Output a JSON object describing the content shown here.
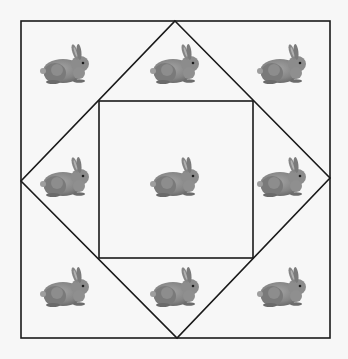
{
  "figure": {
    "background_color": "#f7f7f7",
    "line_color": "#1a1a1a",
    "outer_square": {
      "x1": 21,
      "y1": 21,
      "x2": 330,
      "y2": 338
    },
    "diamond": {
      "top": [
        175,
        21
      ],
      "right": [
        330,
        178
      ],
      "bottom": [
        177,
        338
      ],
      "left": [
        21,
        181
      ]
    },
    "inner_square": {
      "x1": 99,
      "y1": 101,
      "x2": 253,
      "y2": 258
    },
    "rabbit_color": "#8a8a8a",
    "rabbits": [
      {
        "id": "top-left",
        "cx": 67,
        "cy": 67
      },
      {
        "id": "top-center",
        "cx": 177,
        "cy": 67
      },
      {
        "id": "top-right",
        "cx": 284,
        "cy": 67
      },
      {
        "id": "middle-left",
        "cx": 67,
        "cy": 180
      },
      {
        "id": "center",
        "cx": 177,
        "cy": 180
      },
      {
        "id": "middle-right",
        "cx": 284,
        "cy": 180
      },
      {
        "id": "bottom-left",
        "cx": 67,
        "cy": 290
      },
      {
        "id": "bottom-center",
        "cx": 177,
        "cy": 290
      },
      {
        "id": "bottom-right",
        "cx": 284,
        "cy": 290
      }
    ],
    "rabbit_count": 9
  }
}
